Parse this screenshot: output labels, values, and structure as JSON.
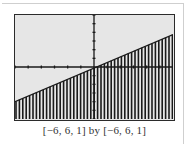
{
  "chart_data": {
    "type": "area",
    "title": "",
    "window": {
      "xmin": -6,
      "xmax": 6,
      "xscl": 1,
      "ymin": -6,
      "ymax": 6,
      "yscl": 1
    },
    "boundary_line": {
      "x": [
        -6,
        6
      ],
      "y": [
        -4,
        3.75
      ]
    },
    "shading": "below",
    "xlabel": "",
    "ylabel": "",
    "xlim": [
      -6,
      6
    ],
    "ylim": [
      -6,
      6
    ],
    "grid": false
  },
  "caption": "[−6, 6, 1] by [−6, 6, 1]",
  "colors": {
    "screen_bg": "#e6e6e6",
    "ink": "#1a1a1a"
  }
}
